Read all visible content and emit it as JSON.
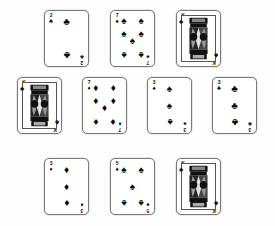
{
  "scene": {
    "title": "Playing cards layout",
    "background_color": "#ffffff",
    "card_face_color": "#ffffff",
    "card_border_color": "#7a7a7a",
    "pip_color": "#0a0a0a"
  },
  "suit_glyphs": {
    "clubs": "♣",
    "spades": "♠",
    "hearts": "♥",
    "diamonds": "♦"
  },
  "rows": [
    {
      "name": "row-top",
      "cards": [
        {
          "rank": "2",
          "suit": "clubs",
          "suit_glyph": "♣",
          "count": 2,
          "face": false,
          "label": "2 of clubs"
        },
        {
          "rank": "7",
          "suit": "spades",
          "suit_glyph": "♠",
          "count": 7,
          "face": false,
          "label": "7 of spades"
        },
        {
          "rank": "K",
          "suit": "spades",
          "suit_glyph": "♠",
          "count": 0,
          "face": true,
          "label": "King of spades"
        }
      ]
    },
    {
      "name": "row-middle",
      "cards": [
        {
          "rank": "K",
          "suit": "spades",
          "suit_glyph": "♠",
          "count": 0,
          "face": true,
          "label": "King of spades"
        },
        {
          "rank": "7",
          "suit": "diamonds",
          "suit_glyph": "♦",
          "count": 7,
          "face": false,
          "label": "7 of diamonds"
        },
        {
          "rank": "3",
          "suit": "spades",
          "suit_glyph": "♠",
          "count": 3,
          "face": false,
          "label": "3 of spades"
        },
        {
          "rank": "3",
          "suit": "clubs",
          "suit_glyph": "♣",
          "count": 3,
          "face": false,
          "label": "3 of clubs"
        }
      ]
    },
    {
      "name": "row-bottom",
      "cards": [
        {
          "rank": "3",
          "suit": "diamonds",
          "suit_glyph": "♦",
          "count": 3,
          "face": false,
          "label": "3 of diamonds"
        },
        {
          "rank": "5",
          "suit": "spades",
          "suit_glyph": "♠",
          "count": 5,
          "face": false,
          "label": "5 of spades"
        },
        {
          "rank": "K",
          "suit": "spades",
          "suit_glyph": "♠",
          "count": 0,
          "face": true,
          "label": "King of spades"
        }
      ]
    }
  ],
  "pip_layouts": {
    "2": [
      [
        50,
        14
      ],
      [
        50,
        86
      ]
    ],
    "3": [
      [
        50,
        14
      ],
      [
        50,
        50
      ],
      [
        50,
        86
      ]
    ],
    "5": [
      [
        20,
        14
      ],
      [
        80,
        14
      ],
      [
        50,
        50
      ],
      [
        20,
        86
      ],
      [
        80,
        86
      ]
    ],
    "7": [
      [
        20,
        12
      ],
      [
        80,
        12
      ],
      [
        20,
        40
      ],
      [
        80,
        40
      ],
      [
        50,
        55
      ],
      [
        20,
        86
      ],
      [
        80,
        86
      ]
    ]
  },
  "pip_flip_from_index": {
    "2": 1,
    "3": 2,
    "5": 3,
    "7": 5
  }
}
